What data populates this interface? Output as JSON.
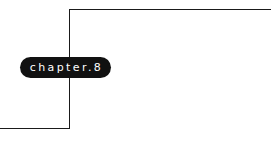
{
  "chapter_badge": {
    "label": "chapter.8",
    "background": "#111111",
    "text_color": "#ffffff"
  },
  "frame": {
    "line_color": "#1a1a1a"
  }
}
